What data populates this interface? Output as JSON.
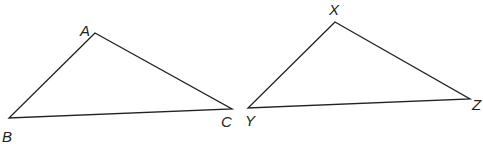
{
  "diagram": {
    "type": "two-triangles",
    "stroke_color": "#222222",
    "background": "#ffffff",
    "triangles": [
      {
        "name": "ABC",
        "vertices": [
          {
            "label": "A",
            "x": 95,
            "y": 33,
            "lx": 80,
            "ly": 36
          },
          {
            "label": "B",
            "x": 9,
            "y": 118,
            "lx": 2,
            "ly": 142
          },
          {
            "label": "C",
            "x": 232,
            "y": 109,
            "lx": 221,
            "ly": 127
          }
        ]
      },
      {
        "name": "XYZ",
        "vertices": [
          {
            "label": "X",
            "x": 335,
            "y": 22,
            "lx": 329,
            "ly": 15
          },
          {
            "label": "Y",
            "x": 248,
            "y": 108,
            "lx": 245,
            "ly": 126
          },
          {
            "label": "Z",
            "x": 470,
            "y": 99,
            "lx": 472,
            "ly": 110
          }
        ]
      }
    ]
  }
}
